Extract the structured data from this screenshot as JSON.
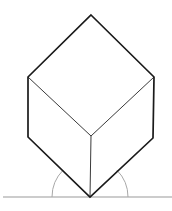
{
  "diagram": {
    "title": "",
    "type": "isometric-cube-on-vertex",
    "colors": {
      "background": "#ffffff",
      "outer_edge": "#1a1a1a",
      "inner_edge": "#3a3a3a",
      "ground": "#9a9a9a",
      "arc": "#a8a8a8"
    },
    "vertices": {
      "top": [
        91,
        15
      ],
      "upper_left": [
        28,
        77
      ],
      "upper_right": [
        154,
        77
      ],
      "lower_left": [
        28,
        137
      ],
      "lower_right": [
        153,
        138
      ],
      "center": [
        91,
        136
      ],
      "bottom": [
        90,
        197
      ]
    },
    "ground_line": {
      "x1": 3,
      "x2": 172,
      "y": 197
    },
    "angle_arcs": {
      "cx": 90,
      "cy": 197,
      "r": 38
    }
  }
}
